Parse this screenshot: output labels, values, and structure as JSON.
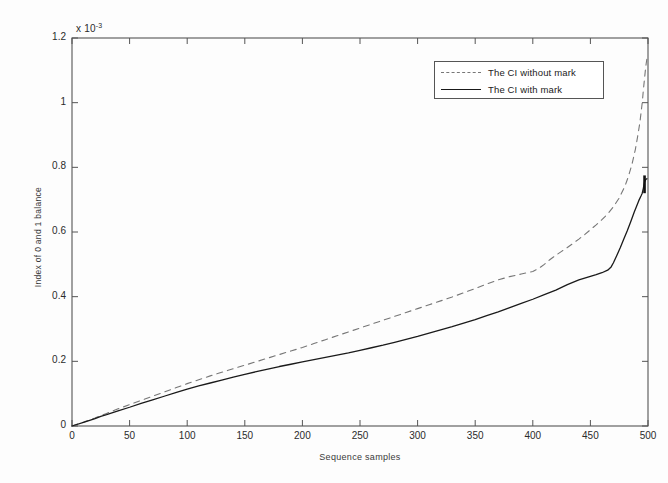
{
  "figure": {
    "exponent_label": "x 10",
    "exponent_value": "-3",
    "background_color": "#fdfdfd",
    "axis_color": "#555555"
  },
  "chart_data": {
    "type": "line",
    "title": "",
    "subtitle": "",
    "xlabel": "Sequence samples",
    "ylabel": "Index of 0 and 1 balance",
    "y_axis_exponent": "x 10^-3",
    "xlim": [
      0,
      500
    ],
    "ylim": [
      0,
      0.0012
    ],
    "xticks": [
      0,
      50,
      100,
      150,
      200,
      250,
      300,
      350,
      400,
      450,
      500
    ],
    "xtick_labels": [
      "0",
      "50",
      "100",
      "150",
      "200",
      "250",
      "300",
      "350",
      "400",
      "450",
      "500"
    ],
    "yticks": [
      0,
      0.0002,
      0.0004,
      0.0006,
      0.0008,
      0.001,
      0.0012
    ],
    "ytick_labels": [
      "0",
      "0.2",
      "0.4",
      "0.6",
      "0.8",
      "1",
      "1.2"
    ],
    "grid": false,
    "legend_position": "upper right",
    "series": [
      {
        "name": "The CI without mark",
        "style": "dashed",
        "color": "#777777",
        "x": [
          0,
          10,
          20,
          25,
          30,
          40,
          50,
          60,
          70,
          80,
          90,
          100,
          110,
          120,
          130,
          140,
          150,
          160,
          170,
          180,
          190,
          200,
          210,
          220,
          230,
          240,
          250,
          260,
          270,
          280,
          290,
          300,
          310,
          320,
          330,
          340,
          350,
          360,
          370,
          380,
          390,
          400,
          405,
          410,
          415,
          420,
          425,
          430,
          435,
          440,
          445,
          450,
          455,
          460,
          465,
          470,
          475,
          480,
          483,
          486,
          489,
          491,
          493,
          495,
          496,
          497,
          498,
          499
        ],
        "y": [
          0.0,
          1.2e-05,
          2.5e-05,
          3.2e-05,
          3.9e-05,
          5.3e-05,
          6.6e-05,
          7.9e-05,
          9.2e-05,
          0.000105,
          0.000118,
          0.000131,
          0.000143,
          0.000155,
          0.000166,
          0.000177,
          0.000188,
          0.000199,
          0.00021,
          0.000221,
          0.000232,
          0.000243,
          0.000255,
          0.000267,
          0.000279,
          0.000291,
          0.000303,
          0.000315,
          0.000327,
          0.000339,
          0.000351,
          0.000363,
          0.000375,
          0.000387,
          0.000399,
          0.000412,
          0.000425,
          0.000439,
          0.000452,
          0.000462,
          0.00047,
          0.000478,
          0.000487,
          0.0005,
          0.000515,
          0.000528,
          0.00054,
          0.000552,
          0.000565,
          0.000578,
          0.000592,
          0.000607,
          0.000622,
          0.000638,
          0.000656,
          0.000678,
          0.000705,
          0.000742,
          0.000772,
          0.000808,
          0.000855,
          0.000895,
          0.00094,
          0.001,
          0.00104,
          0.001075,
          0.00111,
          0.001135
        ]
      },
      {
        "name": "The CI with mark",
        "style": "solid",
        "color": "#1a1a1a",
        "x": [
          0,
          10,
          20,
          25,
          30,
          40,
          50,
          60,
          70,
          80,
          90,
          100,
          110,
          120,
          130,
          140,
          150,
          160,
          170,
          180,
          190,
          200,
          210,
          220,
          230,
          240,
          250,
          260,
          270,
          280,
          290,
          300,
          310,
          320,
          330,
          340,
          350,
          360,
          370,
          380,
          390,
          400,
          410,
          420,
          430,
          440,
          450,
          455,
          460,
          465,
          468,
          470,
          473,
          476,
          479,
          482,
          485,
          488,
          490,
          492,
          494,
          495,
          496,
          497,
          498,
          499
        ],
        "y": [
          0.0,
          1.1e-05,
          2.3e-05,
          3e-05,
          3.5e-05,
          4.7e-05,
          5.8e-05,
          7e-05,
          8.1e-05,
          9.2e-05,
          0.000103,
          0.000114,
          0.000124,
          0.000133,
          0.000142,
          0.000151,
          0.00016,
          0.000168,
          0.000176,
          0.000184,
          0.000191,
          0.000198,
          0.000205,
          0.000212,
          0.000219,
          0.000226,
          0.000234,
          0.000242,
          0.00025,
          0.000259,
          0.000268,
          0.000277,
          0.000287,
          0.000297,
          0.000307,
          0.000318,
          0.000329,
          0.000341,
          0.000353,
          0.000366,
          0.000379,
          0.000392,
          0.000406,
          0.00042,
          0.000437,
          0.000452,
          0.000463,
          0.000468,
          0.000474,
          0.000482,
          0.000492,
          0.000505,
          0.000528,
          0.000552,
          0.000578,
          0.000604,
          0.000632,
          0.000661,
          0.000679,
          0.000697,
          0.000712,
          0.00072,
          0.000736,
          0.000755,
          0.000762,
          0.000765
        ]
      }
    ]
  },
  "legend": {
    "entries": [
      {
        "label": "The CI without mark",
        "style": "dashed"
      },
      {
        "label": "The CI with mark",
        "style": "solid"
      }
    ]
  }
}
